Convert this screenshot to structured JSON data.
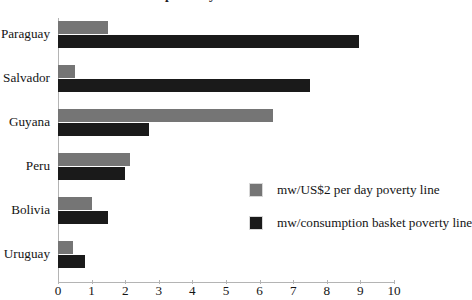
{
  "chart": {
    "title": "proverty lines",
    "title_note": "top line of heading is cropped off the top of the image"
  },
  "chart_data": {
    "type": "bar",
    "orientation": "horizontal",
    "title": "proverty lines",
    "xlabel": "",
    "ylabel": "",
    "xlim": [
      0,
      10
    ],
    "x_ticks": [
      "0",
      "1",
      "2",
      "3",
      "4",
      "5",
      "6",
      "7",
      "8",
      "9",
      "10"
    ],
    "grid": false,
    "legend_position": "center-right inside plot",
    "categories": [
      "Paraguay",
      "El Salvador",
      "Guyana",
      "Peru",
      "Bolivia",
      "Uruguay"
    ],
    "series": [
      {
        "name": "mw/US$2 per day poverty line",
        "color": "#757575",
        "values": [
          1.5,
          0.5,
          6.4,
          2.15,
          1.0,
          0.45
        ]
      },
      {
        "name": "mw/consumption basket poverty line",
        "color": "#1a1a1a",
        "values": [
          8.95,
          7.5,
          2.7,
          2.0,
          1.5,
          0.8
        ]
      }
    ]
  },
  "colors": {
    "background": "#ffffff",
    "axis": "#b4b4b4",
    "text": "#141414",
    "series_light": "#757575",
    "series_dark": "#1a1a1a"
  }
}
